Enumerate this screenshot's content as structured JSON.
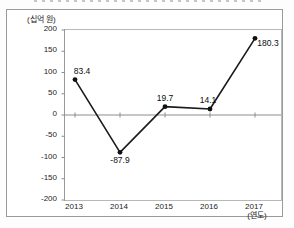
{
  "chart_data": {
    "type": "line",
    "title_remnant": "",
    "unit_label": "(십억 원)",
    "xaxis_label": "(연도)",
    "categories": [
      "2013",
      "2014",
      "2015",
      "2016",
      "2017"
    ],
    "values": [
      83.4,
      -87.9,
      19.7,
      14.1,
      180.3
    ],
    "point_labels": [
      "83.4",
      "-87.9",
      "19.7",
      "14.1",
      "180.3"
    ],
    "yticks": [
      200,
      150,
      100,
      50,
      0,
      -50,
      -100,
      -150,
      -200
    ],
    "ylim": [
      -200,
      200
    ],
    "grid": "zero-line-only",
    "legend": "none",
    "line_color": "#1a1a1a",
    "marker_color": "#111111",
    "axis_color": "#8c8c8c",
    "label_offsets": [
      [
        7,
        -13
      ],
      [
        0,
        4
      ],
      [
        0,
        -13
      ],
      [
        -2,
        -13
      ],
      [
        13,
        1
      ]
    ]
  }
}
